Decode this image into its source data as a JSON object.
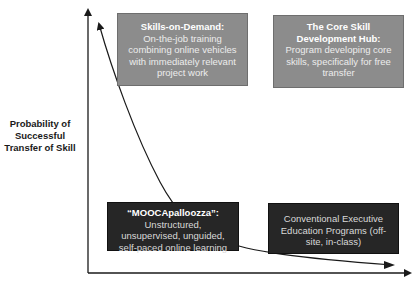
{
  "diagram": {
    "y_axis_label": "Probability of Successful Transfer of Skill",
    "x_axis_label": "",
    "colors": {
      "gray_box": "#8c8c8c",
      "dark_box": "#262626",
      "axis": "#1a1a1a",
      "curve": "#1a1a1a"
    },
    "boxes": [
      {
        "id": "skills-on-demand",
        "title": "Skills-on-Demand:",
        "description": "On-the-job training combining online vehicles with immediately relevant project work",
        "style": "gray",
        "quadrant": "top-left"
      },
      {
        "id": "core-skill-hub",
        "title": "The Core Skill Development Hub:",
        "description": "Program developing core skills, specifically for free transfer",
        "style": "gray",
        "quadrant": "top-right"
      },
      {
        "id": "moocapalooza",
        "title": "“MOOCApalloozza”:",
        "description": "Unstructured, unsupervised, unguided, self-paced online learning",
        "style": "dark",
        "quadrant": "bottom-left"
      },
      {
        "id": "conventional-exec-ed",
        "title": "",
        "description": "Conventional Executive Education Programs (off-site, in-class)",
        "style": "dark",
        "quadrant": "bottom-right"
      }
    ],
    "curve": {
      "shape": "decaying curve from top-left to bottom-right",
      "arrowheads": "both ends"
    }
  }
}
